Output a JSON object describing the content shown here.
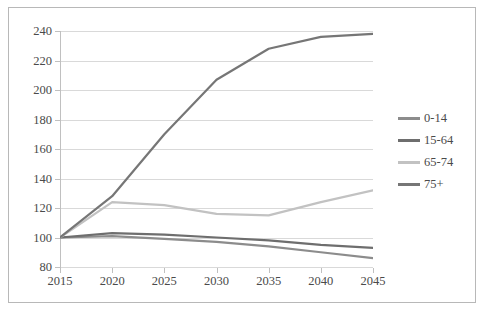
{
  "chart_data": {
    "type": "line",
    "title": "",
    "xlabel": "",
    "ylabel": "",
    "x": [
      2015,
      2020,
      2025,
      2030,
      2035,
      2040,
      2045
    ],
    "categories": [
      "2015",
      "2020",
      "2025",
      "2030",
      "2035",
      "2040",
      "2045"
    ],
    "xlim": [
      2015,
      2045
    ],
    "ylim": [
      80,
      240
    ],
    "y_ticks": [
      80,
      100,
      120,
      140,
      160,
      180,
      200,
      220,
      240
    ],
    "x_ticks": [
      "2015",
      "2020",
      "2025",
      "2030",
      "2035",
      "2040",
      "2045"
    ],
    "grid": true,
    "legend_position": "right",
    "series": [
      {
        "name": "0-14",
        "color": "#8c8c8c",
        "values": [
          100,
          101,
          99,
          97,
          94,
          90,
          86
        ]
      },
      {
        "name": "15-64",
        "color": "#6e6e6e",
        "values": [
          100,
          103,
          102,
          100,
          98,
          95,
          93
        ]
      },
      {
        "name": "65-74",
        "color": "#c2c2c2",
        "values": [
          100,
          124,
          122,
          116,
          115,
          124,
          132
        ]
      },
      {
        "name": "75+",
        "color": "#767676",
        "values": [
          100,
          128,
          170,
          207,
          228,
          236,
          238
        ]
      }
    ]
  },
  "legend": {
    "items": [
      {
        "label": "0-14",
        "color": "#8c8c8c"
      },
      {
        "label": "15-64",
        "color": "#6e6e6e"
      },
      {
        "label": "65-74",
        "color": "#c2c2c2"
      },
      {
        "label": "75+",
        "color": "#767676"
      }
    ]
  },
  "colors": {
    "background": "#ffffff",
    "border": "#b8b8b8",
    "gridline": "#d9d9d9",
    "axis": "#c0c0c0",
    "text": "#4a4a4a"
  }
}
